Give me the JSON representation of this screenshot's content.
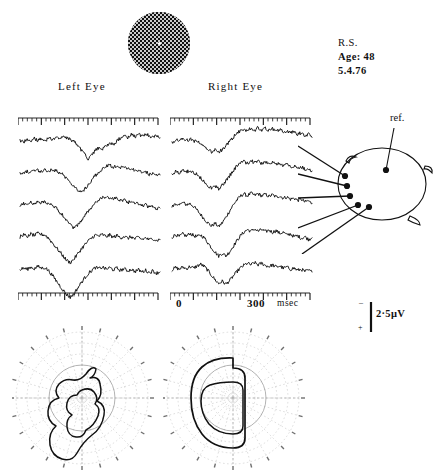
{
  "patient": {
    "initials": "R.S.",
    "age_line": "Age: 48",
    "date": "5.4.76"
  },
  "labels": {
    "left_eye": "Left  Eye",
    "right_eye": "Right  Eye",
    "reference": "ref.",
    "time_zero": "0",
    "time_end": "300",
    "time_unit": "msec",
    "calibration": "2·5μV",
    "polarity_positive": "+",
    "polarity_negative": "–"
  },
  "stimulus": {
    "name": "checkerboard-stimulus",
    "shape": "circle",
    "fixation_point": "center-dot"
  },
  "chart_data": {
    "type": "line",
    "xlabel": "msec",
    "ylabel": "μV",
    "xlim": [
      0,
      400
    ],
    "ylim": [
      -2.5,
      2.5
    ],
    "amplitude_calibration_uv": 2.5,
    "time_calibration_msec": 300,
    "grid": false,
    "legend": "none",
    "tick_interval_msec": 10,
    "major_tick_interval_msec": 50,
    "channels": [
      "1",
      "2",
      "3",
      "4",
      "5"
    ],
    "panels": [
      {
        "name": "Left Eye",
        "series": [
          {
            "name": "ch1",
            "values": [
              0.35,
              0.2,
              0.45,
              0.15,
              0.5,
              0.3,
              0.55,
              0.25,
              0.6,
              0.35,
              0.7,
              0.4,
              0.75,
              0.5,
              0.45,
              0.2,
              -0.1,
              -0.5,
              -0.95,
              -1.35,
              -1.05,
              -0.6,
              -0.3,
              -0.45,
              -0.15,
              0.1,
              -0.1,
              0.25,
              0.55,
              0.75,
              0.6,
              0.85,
              0.65,
              0.9,
              0.7,
              0.95,
              0.75,
              0.6,
              0.8,
              0.55
            ]
          },
          {
            "name": "ch2",
            "values": [
              0.3,
              0.35,
              0.4,
              0.3,
              0.45,
              0.5,
              0.4,
              0.55,
              0.45,
              0.6,
              0.5,
              0.3,
              0.1,
              -0.2,
              -0.55,
              -0.9,
              -1.25,
              -1.5,
              -1.2,
              -0.75,
              -0.35,
              0.05,
              0.35,
              0.6,
              0.85,
              1.0,
              0.8,
              0.95,
              0.75,
              0.85,
              0.6,
              0.7,
              0.45,
              0.55,
              0.3,
              0.4,
              0.15,
              0.25,
              0.05,
              0.1
            ]
          },
          {
            "name": "ch3",
            "values": [
              0.25,
              0.4,
              0.3,
              0.5,
              0.35,
              0.55,
              0.45,
              0.6,
              0.4,
              0.3,
              0.0,
              -0.35,
              -0.7,
              -1.1,
              -1.5,
              -1.8,
              -1.55,
              -1.15,
              -0.7,
              -0.3,
              0.1,
              0.45,
              0.7,
              0.95,
              0.85,
              1.0,
              0.8,
              0.9,
              0.65,
              0.75,
              0.5,
              0.6,
              0.35,
              0.45,
              0.2,
              0.3,
              0.05,
              0.15,
              -0.05,
              0.0
            ]
          },
          {
            "name": "ch4",
            "values": [
              0.3,
              0.45,
              0.35,
              0.55,
              0.4,
              0.6,
              0.5,
              0.45,
              0.15,
              -0.25,
              -0.65,
              -1.05,
              -1.45,
              -1.85,
              -2.05,
              -1.75,
              -1.3,
              -0.85,
              -0.45,
              -0.1,
              0.2,
              0.45,
              0.35,
              0.5,
              0.3,
              0.45,
              0.25,
              0.4,
              0.2,
              0.35,
              0.15,
              0.3,
              0.1,
              0.25,
              0.05,
              0.2,
              0.0,
              0.15,
              -0.05,
              0.05
            ]
          },
          {
            "name": "ch5",
            "values": [
              0.2,
              0.35,
              0.25,
              0.45,
              0.3,
              0.5,
              0.35,
              0.4,
              0.1,
              -0.3,
              -0.75,
              -1.2,
              -1.65,
              -2.05,
              -2.3,
              -2.0,
              -1.5,
              -1.0,
              -0.55,
              -0.15,
              0.15,
              0.4,
              0.3,
              0.45,
              0.25,
              0.4,
              0.2,
              0.35,
              0.15,
              0.3,
              0.1,
              0.25,
              0.05,
              0.2,
              0.0,
              0.15,
              -0.05,
              0.1,
              -0.1,
              0.0
            ]
          }
        ]
      },
      {
        "name": "Right Eye",
        "series": [
          {
            "name": "ch1",
            "values": [
              0.1,
              0.4,
              0.2,
              0.5,
              0.3,
              0.45,
              0.25,
              0.35,
              0.05,
              -0.25,
              -0.5,
              -0.7,
              -0.55,
              -0.75,
              -0.5,
              -0.2,
              0.2,
              0.6,
              0.95,
              1.2,
              1.4,
              1.2,
              1.45,
              1.25,
              1.5,
              1.3,
              1.45,
              1.25,
              1.4,
              1.2,
              1.3,
              1.1,
              1.2,
              1.0,
              1.1,
              0.9,
              1.0,
              0.8,
              0.9,
              0.6
            ]
          },
          {
            "name": "ch2",
            "values": [
              0.15,
              0.45,
              0.25,
              0.55,
              0.35,
              0.5,
              0.3,
              0.15,
              -0.2,
              -0.55,
              -0.85,
              -1.1,
              -0.9,
              -1.15,
              -0.85,
              -0.45,
              0.0,
              0.45,
              0.85,
              1.15,
              1.35,
              1.15,
              1.4,
              1.2,
              1.35,
              1.15,
              1.3,
              1.1,
              1.25,
              1.05,
              1.15,
              0.95,
              1.05,
              0.85,
              0.95,
              0.75,
              0.85,
              0.6,
              0.7,
              0.45
            ]
          },
          {
            "name": "ch3",
            "values": [
              0.1,
              0.4,
              0.2,
              0.5,
              0.3,
              0.4,
              0.15,
              -0.2,
              -0.6,
              -1.0,
              -1.35,
              -1.65,
              -1.4,
              -1.7,
              -1.35,
              -0.85,
              -0.3,
              0.25,
              0.7,
              1.05,
              1.3,
              1.1,
              1.35,
              1.15,
              1.3,
              1.1,
              1.25,
              1.05,
              1.2,
              1.0,
              1.1,
              0.9,
              1.0,
              0.8,
              0.9,
              0.7,
              0.8,
              0.55,
              0.65,
              0.4
            ]
          },
          {
            "name": "ch4",
            "values": [
              0.25,
              0.5,
              0.3,
              0.55,
              0.35,
              0.6,
              0.4,
              0.3,
              0.45,
              0.2,
              -0.25,
              -0.7,
              -1.1,
              -1.45,
              -1.2,
              -1.45,
              -1.1,
              -0.6,
              -0.1,
              0.35,
              0.7,
              0.95,
              0.8,
              1.0,
              0.8,
              0.95,
              0.75,
              0.9,
              0.7,
              0.85,
              0.6,
              0.7,
              0.45,
              0.55,
              0.3,
              0.4,
              0.15,
              0.3,
              0.05,
              0.2
            ]
          },
          {
            "name": "ch5",
            "values": [
              0.2,
              0.4,
              0.25,
              0.45,
              0.3,
              0.5,
              0.35,
              0.55,
              0.7,
              0.5,
              0.15,
              -0.3,
              -0.7,
              -1.05,
              -0.85,
              -1.1,
              -0.8,
              -0.4,
              0.0,
              0.35,
              0.6,
              0.8,
              0.65,
              0.85,
              0.65,
              0.8,
              0.6,
              0.5,
              0.65,
              0.45,
              0.55,
              0.35,
              0.45,
              0.25,
              0.35,
              0.15,
              0.25,
              0.05,
              0.15,
              0.0
            ]
          }
        ]
      }
    ]
  },
  "montage": {
    "name": "head-electrode-montage",
    "view": "top-down",
    "reference_label": "ref.",
    "electrode_count": 5,
    "electrodes": [
      "1",
      "2",
      "3",
      "4",
      "5"
    ],
    "reference_electrode": "ref"
  },
  "perimetry": [
    {
      "name": "left-eye-visual-field",
      "eye": "left",
      "grid_rings": 6,
      "grid_meridians": 24
    },
    {
      "name": "right-eye-visual-field",
      "eye": "right",
      "grid_rings": 6,
      "grid_meridians": 24
    }
  ],
  "colors": {
    "ink": "#111111",
    "grid": "#b4b4b4",
    "paper": "#ffffff"
  }
}
